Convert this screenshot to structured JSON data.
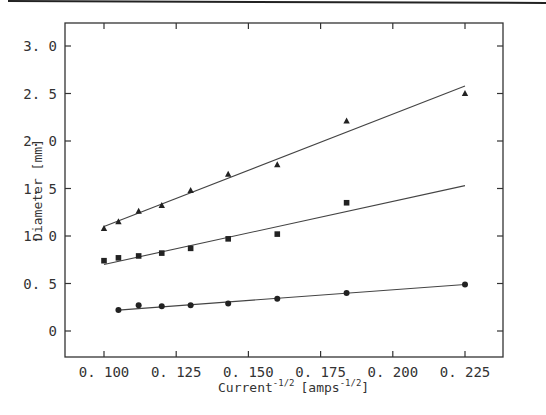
{
  "chart_data": {
    "type": "scatter",
    "title": "",
    "xlabel": "Current^-1/2 [amps^-1/2]",
    "ylabel": "Diameter [mm]",
    "xlim": [
      0.088,
      0.238
    ],
    "ylim": [
      -0.25,
      3.2
    ],
    "x_ticks": [
      "0.100",
      "0.125",
      "0.150",
      "0.175",
      "0.200",
      "0.225"
    ],
    "y_ticks": [
      "0",
      "0.5",
      "1.0",
      "1.5",
      "2.0",
      "2.5",
      "3.0"
    ],
    "grid": false,
    "legend": null,
    "series": [
      {
        "name": "triangles",
        "marker": "triangle",
        "x": [
          0.1,
          0.105,
          0.112,
          0.12,
          0.13,
          0.143,
          0.16,
          0.184,
          0.225
        ],
        "y": [
          1.08,
          1.15,
          1.26,
          1.32,
          1.48,
          1.65,
          1.75,
          2.21,
          2.5
        ],
        "fit": {
          "x": [
            0.1,
            0.225
          ],
          "y": [
            1.1,
            2.58
          ]
        }
      },
      {
        "name": "squares",
        "marker": "square",
        "x": [
          0.1,
          0.105,
          0.112,
          0.12,
          0.13,
          0.143,
          0.16,
          0.184
        ],
        "y": [
          0.74,
          0.77,
          0.79,
          0.82,
          0.87,
          0.97,
          1.02,
          1.35
        ],
        "fit": {
          "x": [
            0.1,
            0.225
          ],
          "y": [
            0.7,
            1.53
          ]
        }
      },
      {
        "name": "circles",
        "marker": "circle",
        "x": [
          0.105,
          0.112,
          0.12,
          0.13,
          0.143,
          0.16,
          0.184,
          0.225
        ],
        "y": [
          0.22,
          0.27,
          0.26,
          0.27,
          0.29,
          0.34,
          0.4,
          0.49
        ],
        "fit": {
          "x": [
            0.105,
            0.225
          ],
          "y": [
            0.22,
            0.49
          ]
        }
      }
    ]
  },
  "labels": {
    "ylabel_text": "Diameter [mm]",
    "xlabel_main": "Current",
    "xlabel_sup": "-1/2",
    "xlabel_unit": "[amps",
    "xlabel_unit_sup": "-1/2",
    "xlabel_close": "]"
  }
}
